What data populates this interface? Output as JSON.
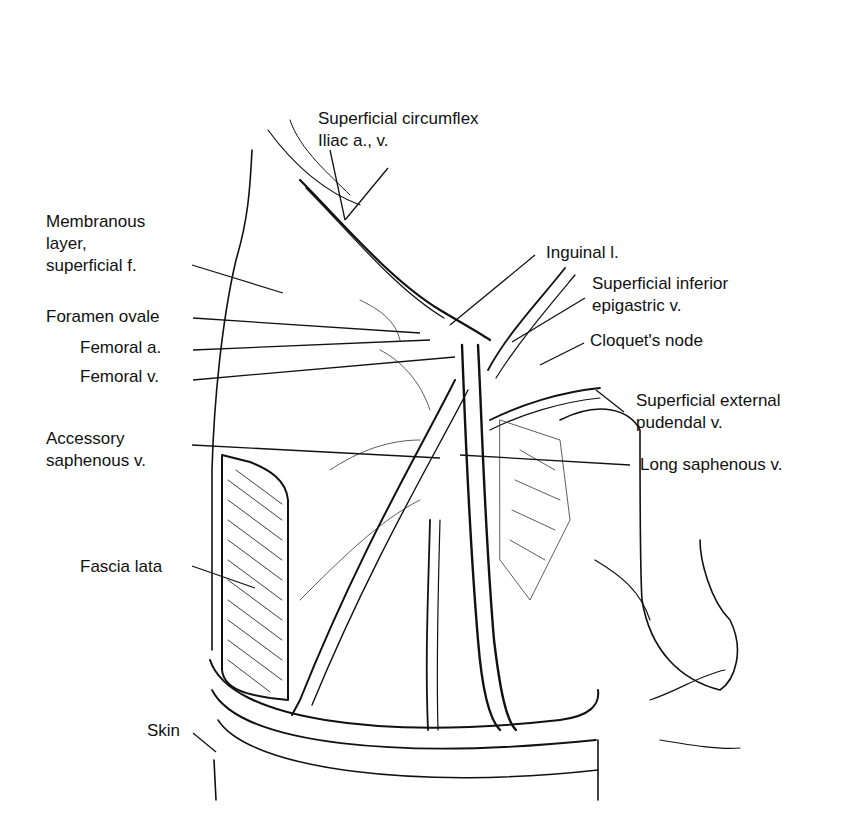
{
  "figure": {
    "labels": [
      {
        "id": "superficial-circumflex-iliac",
        "lines": [
          "Superficial circumflex",
          "Iliac a., v."
        ],
        "x": 318,
        "y": 108,
        "anchor": [
          330,
          150
        ],
        "target": [
          345,
          220
        ]
      },
      {
        "id": "membranous-layer",
        "lines": [
          "Membranous",
          "layer,",
          "superficial f."
        ],
        "x": 46,
        "y": 211,
        "anchor": [
          192,
          265
        ],
        "target": [
          283,
          293
        ]
      },
      {
        "id": "foramen-ovale",
        "lines": [
          "Foramen ovale"
        ],
        "x": 46,
        "y": 308,
        "anchor": [
          193,
          318
        ],
        "target": [
          420,
          333
        ]
      },
      {
        "id": "femoral-artery",
        "lines": [
          "Femoral a."
        ],
        "x": 80,
        "y": 339,
        "anchor": [
          193,
          350
        ],
        "target": [
          430,
          340
        ]
      },
      {
        "id": "femoral-vein",
        "lines": [
          "Femoral v."
        ],
        "x": 80,
        "y": 368,
        "anchor": [
          193,
          380
        ],
        "target": [
          455,
          357
        ]
      },
      {
        "id": "inguinal-ligament",
        "lines": [
          "Inguinal l."
        ],
        "x": 546,
        "y": 244,
        "anchor": [
          535,
          255
        ],
        "target": [
          450,
          325
        ]
      },
      {
        "id": "superficial-inferior-epigastric",
        "lines": [
          "Superficial inferior",
          "epigastric v."
        ],
        "x": 592,
        "y": 275,
        "anchor": [
          585,
          298
        ],
        "target": [
          512,
          342
        ]
      },
      {
        "id": "cloquets-node",
        "lines": [
          "Cloquet's node"
        ],
        "x": 590,
        "y": 331,
        "anchor": [
          584,
          343
        ],
        "target": [
          540,
          365
        ]
      },
      {
        "id": "superficial-external-pudendal",
        "lines": [
          "Superficial external",
          "pudendal v."
        ],
        "x": 636,
        "y": 391,
        "anchor": [
          624,
          412
        ],
        "target": [
          590,
          388
        ]
      },
      {
        "id": "accessory-saphenous",
        "lines": [
          "Accessory",
          "saphenous v."
        ],
        "x": 46,
        "y": 430,
        "anchor": [
          192,
          445
        ],
        "target": [
          440,
          458
        ]
      },
      {
        "id": "long-saphenous",
        "lines": [
          "Long saphenous v."
        ],
        "x": 640,
        "y": 456,
        "anchor": [
          630,
          465
        ],
        "target": [
          460,
          455
        ]
      },
      {
        "id": "fascia-lata",
        "lines": [
          "Fascia lata"
        ],
        "x": 80,
        "y": 560,
        "anchor": [
          192,
          566
        ],
        "target": [
          255,
          588
        ]
      },
      {
        "id": "skin",
        "lines": [
          "Skin"
        ],
        "x": 147,
        "y": 722,
        "anchor": [
          193,
          733
        ],
        "target": [
          216,
          752
        ]
      }
    ]
  }
}
